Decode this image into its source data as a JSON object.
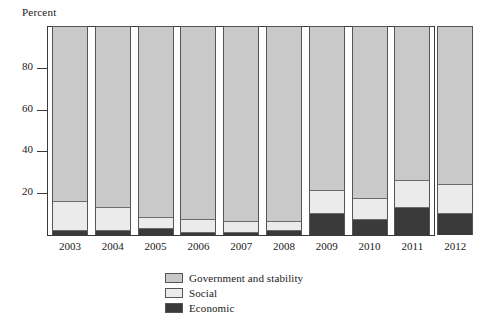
{
  "chart_data": {
    "type": "bar",
    "title": "",
    "subtitle": "",
    "xlabel": "",
    "ylabel": "Percent",
    "ylim": [
      0,
      100
    ],
    "yticks": [
      20,
      40,
      60,
      80
    ],
    "ytick_labels": [
      "20",
      "40",
      "60",
      "80"
    ],
    "grid": false,
    "stacked": true,
    "stack_total": 100,
    "legend_position": "bottom-center",
    "categories": [
      "2003",
      "2004",
      "2005",
      "2006",
      "2007",
      "2008",
      "2009",
      "2010",
      "2011",
      "2012"
    ],
    "series": [
      {
        "name": "Government and stability",
        "color": "#c9c9c9",
        "values": [
          84,
          87,
          92,
          93,
          94,
          94,
          79,
          83,
          74,
          76
        ]
      },
      {
        "name": "Social",
        "color": "#ebebeb",
        "values": [
          14,
          11,
          5,
          6,
          5,
          4,
          11,
          10,
          13,
          14
        ]
      },
      {
        "name": "Economic",
        "color": "#3a3a3a",
        "values": [
          2,
          2,
          3,
          1,
          1,
          2,
          10,
          7,
          13,
          10
        ]
      }
    ]
  },
  "legend": {
    "entries": [
      {
        "label": "Government and stability",
        "color": "#c9c9c9"
      },
      {
        "label": "Social",
        "color": "#ebebeb"
      },
      {
        "label": "Economic",
        "color": "#3a3a3a"
      }
    ]
  }
}
